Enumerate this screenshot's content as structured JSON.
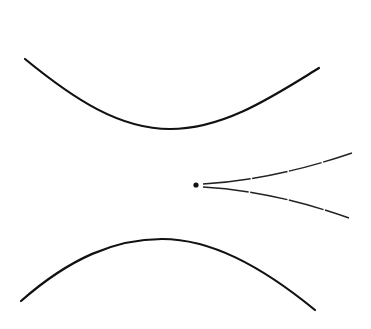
{
  "diagram": {
    "background": "#ffffff",
    "stroke_color": "#111111",
    "elements": {
      "upper_boundary_curve": {
        "d": "M25,59 C75,100 120,129 170,129 C225,129 275,95 319,68",
        "width": 2.2
      },
      "lower_boundary_curve": {
        "d": "M21,301 C70,258 115,239 162,239 C210,239 260,265 315,310",
        "width": 2.2
      },
      "source_point": {
        "cx": 196,
        "cy": 185,
        "r": 2.6
      },
      "upper_ray": {
        "d": "M203,184 C240,182 290,174 352,153",
        "width": 1.4,
        "dash": "48 1.5 36 1.5 34 1.5 60"
      },
      "lower_ray": {
        "d": "M203,187 C240,189 290,197 349,218",
        "width": 1.4,
        "dash": "46 1.5 38 1.5 36 1.5 60"
      }
    }
  }
}
